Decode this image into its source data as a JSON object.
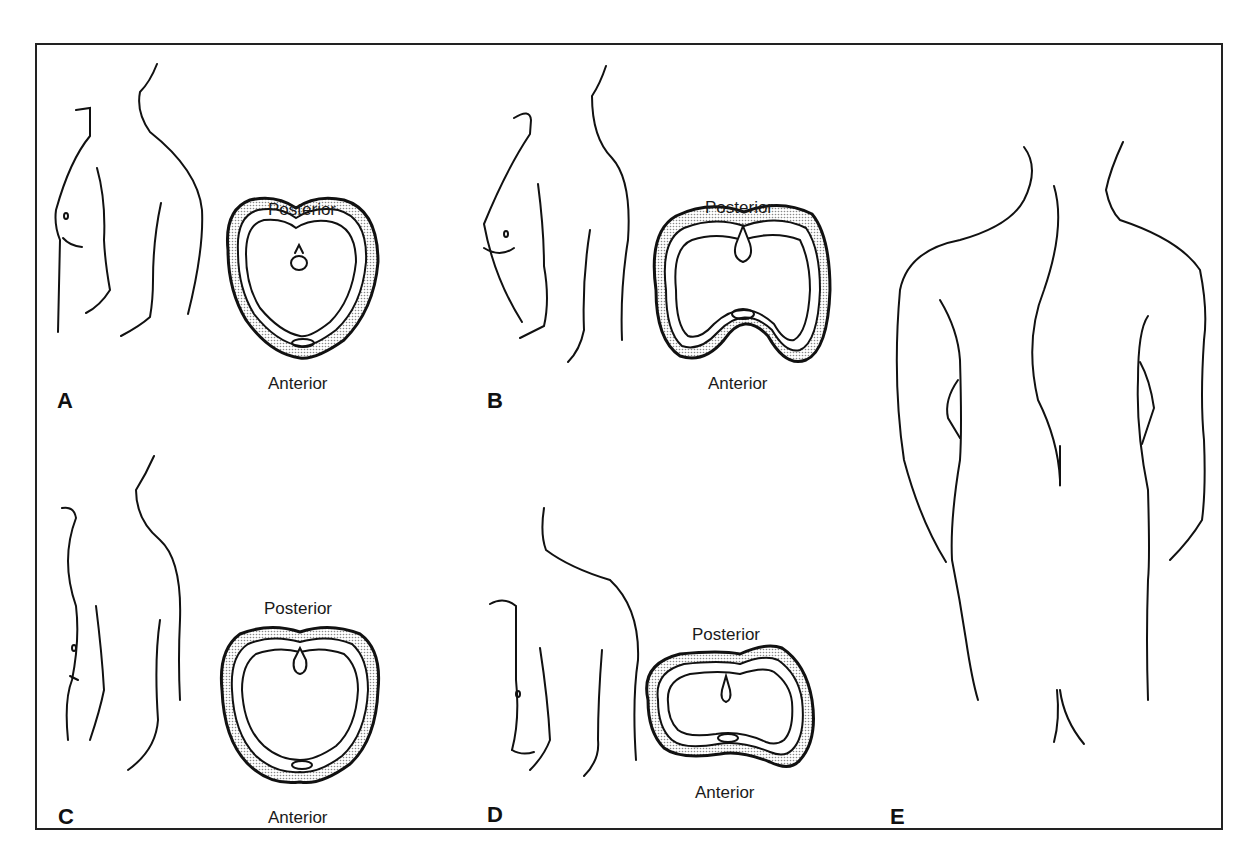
{
  "figure": {
    "panels": [
      {
        "label": "A",
        "posterior": "Posterior",
        "anterior": "Anterior",
        "description": "Side-view torso outline and heart-shaped thoracic cross-section (normal)"
      },
      {
        "label": "B",
        "posterior": "Posterior",
        "anterior": "Anterior",
        "description": "Side-view torso outline with pectus-type deformation; cross-section indented anteriorly"
      },
      {
        "label": "C",
        "posterior": "Posterior",
        "anterior": "Anterior",
        "description": "Side-view torso outline and rounded thoracic cross-section"
      },
      {
        "label": "D",
        "posterior": "Posterior",
        "anterior": "Anterior",
        "description": "Side-view torso outline with kyphotic back; flattened, tilted cross-section"
      },
      {
        "label": "E",
        "description": "Posterior view of torso showing lateral spinal curvature (scoliosis)"
      }
    ]
  }
}
